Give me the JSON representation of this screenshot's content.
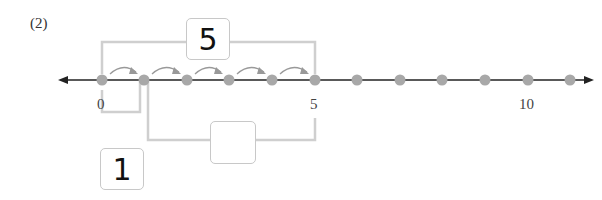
{
  "problem_label": "(2)",
  "number_line": {
    "min": 0,
    "max": 10,
    "points": [
      0,
      1,
      2,
      3,
      4,
      5,
      6,
      7,
      8,
      9,
      10
    ],
    "tick_labels": [
      {
        "value": 0,
        "text": "0"
      },
      {
        "value": 5,
        "text": "5"
      },
      {
        "value": 10,
        "text": "10"
      }
    ],
    "dot_color": "#a8a8a8",
    "line_color": "#222222",
    "hops": [
      [
        0,
        1
      ],
      [
        1,
        2
      ],
      [
        2,
        3
      ],
      [
        3,
        4
      ],
      [
        4,
        5
      ]
    ]
  },
  "boxes": {
    "top_total": "5",
    "bottom_left": "1",
    "bottom_right": ""
  }
}
